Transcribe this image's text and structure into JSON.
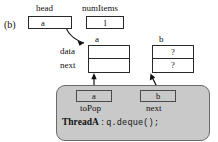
{
  "figure": {
    "panel_label": "(b)",
    "background": "#ffffff",
    "shaded_color": "#c9c9c9",
    "line_color": "#2a2a2a"
  },
  "head": {
    "label": "head",
    "value": "a"
  },
  "num_items": {
    "label": "numItems",
    "value": "1"
  },
  "node_a": {
    "label": "a",
    "field_labels": {
      "data": "data",
      "next": "next"
    },
    "data_value": "",
    "next_value": "null-slash"
  },
  "node_b": {
    "label": "b",
    "top_value": "?",
    "bottom_value": "?"
  },
  "thread": {
    "name": "ThreadA",
    "separator": ":",
    "code": "q.deque();",
    "locals": [
      {
        "label": "toPop",
        "value": "a"
      },
      {
        "label": "next",
        "value": "b"
      }
    ]
  }
}
